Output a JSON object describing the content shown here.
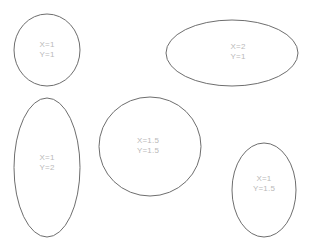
{
  "canvas": {
    "width": 310,
    "height": 247,
    "background_color": "#ffffff",
    "stroke_color": "#6e6e6e",
    "text_color": "#b9b9b9"
  },
  "shapes": [
    {
      "name": "ellipse-x1-y1",
      "cx": 47,
      "cy": 50,
      "rx": 33,
      "ry": 36,
      "label_cx": 47,
      "label_cy": 50,
      "x_label": "X=1",
      "y_label": "Y=1",
      "x_value": 1,
      "y_value": 1
    },
    {
      "name": "ellipse-x2-y1",
      "cx": 232,
      "cy": 53,
      "rx": 66,
      "ry": 33,
      "label_cx": 238,
      "label_cy": 52,
      "x_label": "X=2",
      "y_label": "Y=1",
      "x_value": 2,
      "y_value": 1
    },
    {
      "name": "ellipse-x1-y2",
      "cx": 47,
      "cy": 167.5,
      "rx": 33,
      "ry": 69.5,
      "label_cx": 47,
      "label_cy": 163,
      "x_label": "X=1",
      "y_label": "Y=2",
      "x_value": 1,
      "y_value": 2
    },
    {
      "name": "ellipse-x15-y15",
      "cx": 150,
      "cy": 146.5,
      "rx": 51,
      "ry": 49.5,
      "label_cx": 148,
      "label_cy": 146,
      "x_label": "X=1.5",
      "y_label": "Y=1.5",
      "x_value": 1.5,
      "y_value": 1.5
    },
    {
      "name": "ellipse-x1-y15",
      "cx": 264,
      "cy": 190,
      "rx": 32,
      "ry": 47,
      "label_cx": 264,
      "label_cy": 184,
      "x_label": "X=1",
      "y_label": "Y=1.5",
      "x_value": 1,
      "y_value": 1.5
    }
  ]
}
